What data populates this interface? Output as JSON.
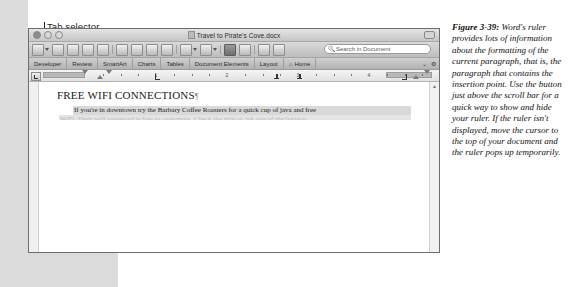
{
  "annotations": {
    "left": [
      {
        "label": "Tab selector",
        "lx": 44,
        "ly": 22,
        "tx": 44,
        "ty": 32,
        "len": 110
      },
      {
        "label": "Left margin",
        "lx": 58,
        "ly": 35,
        "tx": 58,
        "ty": 45,
        "len": 98
      },
      {
        "label": "Left indent",
        "lx": 74,
        "ly": 48,
        "tx": 74,
        "ty": 58,
        "len": 85
      },
      {
        "label": "First line indent",
        "lx": 83,
        "ly": 61,
        "tx": 83,
        "ty": 71,
        "len": 72
      },
      {
        "label": "Left tab",
        "lx": 128,
        "ly": 74,
        "tx": 128,
        "ty": 84,
        "len": 59
      }
    ],
    "mid": [
      {
        "label": "Center tab",
        "lx": 248,
        "ly": 61,
        "tx": 248,
        "ty": 71,
        "len": 72
      },
      {
        "label": "Decimal tab",
        "lx": 271,
        "ly": 74,
        "tx": 271,
        "ty": 84,
        "len": 59
      }
    ],
    "right": [
      {
        "label": "Right tab",
        "lx": 376,
        "ly": 35,
        "tx": 376,
        "ty": 45,
        "len": 98
      },
      {
        "label": "Right indent",
        "lx": 390,
        "ly": 48,
        "tx": 390,
        "ty": 58,
        "len": 85
      },
      {
        "label": "Right",
        "lx": 410,
        "ly": 61,
        "tx": 410,
        "ty": 71,
        "len": 72
      },
      {
        "label": "margin",
        "lx": 410,
        "ly": 74,
        "tx": 410,
        "ty": 84,
        "len": 0
      }
    ]
  },
  "window": {
    "title": "Travel to Pirate's Cove.docx",
    "traffic_lights": [
      "close",
      "minimize",
      "zoom"
    ],
    "search": {
      "placeholder": "Search in Document",
      "icon": "magnifier-icon"
    },
    "toolbar_icons": [
      "new-document-icon",
      "open-icon",
      "save-icon",
      "print-icon",
      "cut-icon",
      "copy-icon",
      "paste-icon",
      "format-painter-icon",
      "undo-icon",
      "redo-icon",
      "show-formatting-icon",
      "sidebar-icon",
      "gallery-icon",
      "media-icon"
    ],
    "ribbon_tabs": [
      "Home",
      "Layout",
      "Document Elements",
      "Tables",
      "Charts",
      "SmartArt",
      "Review",
      "Developer"
    ],
    "ribbon_right_icons": [
      "collapse-ribbon-icon",
      "settings-gear-icon"
    ],
    "ruler": {
      "numbers": [
        "1",
        "2",
        "3",
        "4",
        "5"
      ],
      "markers": [
        {
          "name": "tab-selector",
          "x": 2
        },
        {
          "name": "left-margin",
          "x": 56
        },
        {
          "name": "left-indent",
          "x": 71
        },
        {
          "name": "first-line-indent",
          "x": 80
        },
        {
          "name": "left-tab",
          "x": 126
        },
        {
          "name": "center-tab",
          "x": 245
        },
        {
          "name": "decimal-tab",
          "x": 268
        },
        {
          "name": "right-tab",
          "x": 373
        },
        {
          "name": "right-indent",
          "x": 387
        },
        {
          "name": "right-margin",
          "x": 398
        }
      ]
    },
    "document": {
      "heading": "FREE WIFI CONNECTIONS",
      "heading_mark": "¶",
      "paragraph": "If you're in downtown try the Barbary Coffee Roasters for a quick cup of java and free",
      "paragraph_faded": "WiFi. Their wifi password is free to customers. Check the sign or ask one of the baristas."
    }
  },
  "caption": {
    "figure_number": "Figure 3-39:",
    "body": "Word's ruler provides lots of information about the formatting of the current paragraph, that is, the paragraph that contains the insertion point. Use the button just above the scroll bar for a quick way to show and hide your ruler. If the ruler isn't displayed, move the cursor to the top of your document and the ruler pops up temporarily."
  }
}
